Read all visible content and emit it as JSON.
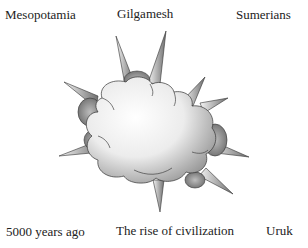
{
  "labels": {
    "top_left": "Mesopotamia",
    "top_center": "Gilgamesh",
    "top_right": "Sumerians",
    "bottom_left": "5000 years ago",
    "bottom_center": "The rise of civilization",
    "bottom_right": "Uruk"
  },
  "graphic": {
    "type": "cloud-burst-with-spikes",
    "fill": "#f2f2f2",
    "shade": "#8a8a8a",
    "stroke": "#333333"
  }
}
